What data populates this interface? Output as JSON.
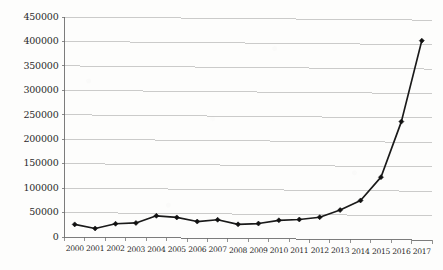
{
  "chart_data": {
    "type": "line",
    "title": "",
    "subtitle": "",
    "xlabel": "",
    "ylabel": "",
    "categories": [
      "2000",
      "2001",
      "2002",
      "2003",
      "2004",
      "2005",
      "2006",
      "2007",
      "2008",
      "2009",
      "2010",
      "2011",
      "2012",
      "2013",
      "2014",
      "2015",
      "2016",
      "2017"
    ],
    "series": [
      {
        "name": "value",
        "values": [
          26000,
          18000,
          28000,
          30000,
          45000,
          42000,
          34000,
          38000,
          29000,
          31000,
          38000,
          40000,
          45000,
          60000,
          80000,
          128000,
          242000,
          408000
        ]
      }
    ],
    "ylim": [
      0,
      450000
    ],
    "ytick_values": [
      0,
      50000,
      100000,
      150000,
      200000,
      250000,
      300000,
      350000,
      400000,
      450000
    ],
    "ytick_labels": [
      "0",
      "50000",
      "100000",
      "150000",
      "200000",
      "250000",
      "300000",
      "350000",
      "400000",
      "450000"
    ],
    "grid": true,
    "grid_axis": "y",
    "legend": false,
    "legend_position": "none",
    "marker": "diamond",
    "line_color": "#1a1a1a",
    "marker_color": "#111111",
    "grid_color": "#b9b9b9",
    "axis_color": "#6e6e6e",
    "background_color": "#fdfdfc",
    "annotations": []
  }
}
